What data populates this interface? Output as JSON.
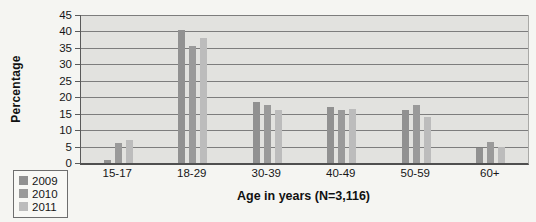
{
  "chart_data": {
    "type": "bar",
    "title": "",
    "xlabel": "Age in years (N=3,116)",
    "ylabel": "Percentage",
    "categories": [
      "15-17",
      "18-29",
      "30-39",
      "40-49",
      "50-59",
      "60+"
    ],
    "series": [
      {
        "name": "2009",
        "color": "#919191",
        "values": [
          1,
          40.5,
          18.5,
          17,
          16,
          4.5
        ]
      },
      {
        "name": "2010",
        "color": "#9a9a9a",
        "values": [
          6,
          35.5,
          17.5,
          16,
          17.5,
          6.5
        ]
      },
      {
        "name": "2011",
        "color": "#bcbcbc",
        "values": [
          7,
          38,
          16,
          16.5,
          14,
          5
        ]
      }
    ],
    "ylim": [
      0,
      45
    ],
    "ytick_step": 5,
    "yticks": [
      0,
      5,
      10,
      15,
      20,
      25,
      30,
      35,
      40,
      45
    ],
    "grid": true,
    "legend_position": "bottom-left"
  },
  "style": {
    "plot_background": "#e2e2df",
    "page_background": "#f5f5f2",
    "gridline_color": "#7d7d7d",
    "text_color": "#161616"
  }
}
